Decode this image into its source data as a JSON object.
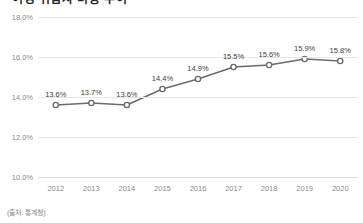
{
  "chart_data": {
    "type": "line",
    "title": "여성 취업자 비중 추이",
    "categories": [
      "2012",
      "2013",
      "2014",
      "2015",
      "2016",
      "2017",
      "2018",
      "2019",
      "2020"
    ],
    "values": [
      13.6,
      13.7,
      13.6,
      14.4,
      14.9,
      15.5,
      15.6,
      15.9,
      15.8
    ],
    "data_labels": [
      "13.6%",
      "13.7%",
      "13.6%",
      "14.4%",
      "14.9%",
      "15.5%",
      "15.6%",
      "15.9%",
      "15.8%"
    ],
    "ytick_labels": [
      "18.0%",
      "16.0%",
      "14.0%",
      "12.0%",
      "10.0%"
    ],
    "yticks": [
      18.0,
      16.0,
      14.0,
      12.0,
      10.0
    ],
    "ylim": [
      10.0,
      18.0
    ],
    "xlabel": "",
    "ylabel": "",
    "grid": true,
    "legend": false,
    "series_color": "#6b6b6b",
    "marker": "open-circle",
    "marker_fill": "#ffffff",
    "gridline_color": "#e6e6e6",
    "tick_label_color": "#8a8a8a",
    "data_label_color": "#3d3d3d"
  },
  "source": {
    "note": "(출처: 통계청)"
  }
}
